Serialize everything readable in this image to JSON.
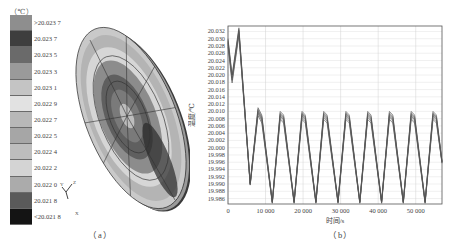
{
  "figure": {
    "panel_a": {
      "caption": "（a）",
      "unit_label": "（℃）",
      "legend": [
        {
          "label": ">20.023 7",
          "color": "#8e8e8e"
        },
        {
          "label": "20.023 7",
          "color": "#3e3e3e"
        },
        {
          "label": "20.023 5",
          "color": "#6a6a6a"
        },
        {
          "label": "20.023 3",
          "color": "#9a9a9a"
        },
        {
          "label": "20.023 1",
          "color": "#c4c4c4"
        },
        {
          "label": "20.022 9",
          "color": "#e2e2e2"
        },
        {
          "label": "20.022 7",
          "color": "#b8b8b8"
        },
        {
          "label": "20.022 5",
          "color": "#a6a6a6"
        },
        {
          "label": "20.022 4",
          "color": "#bdbdbd"
        },
        {
          "label": "20.022 2",
          "color": "#d4d4d4"
        },
        {
          "label": "20.022 0",
          "color": "#ababab"
        },
        {
          "label": "20.021 8",
          "color": "#5a5a5a"
        },
        {
          "label": "<20.021 8",
          "color": "#141414"
        }
      ],
      "axes_triad": {
        "x": "X",
        "y": "Y",
        "z": "Z"
      }
    },
    "panel_b": {
      "caption": "（b）"
    }
  },
  "chart_data": {
    "type": "line",
    "title": "",
    "xlabel": "时间/s",
    "ylabel": "温度/℃",
    "xlim": [
      0,
      57000
    ],
    "ylim": [
      19.9845,
      20.0335
    ],
    "grid": true,
    "legend": "none",
    "x_ticks": [
      0,
      10000,
      20000,
      30000,
      40000,
      50000
    ],
    "x_tick_labels": [
      "0",
      "10 000",
      "20 000",
      "30 000",
      "40 000",
      "50 000"
    ],
    "y_ticks": [
      20.032,
      20.03,
      20.028,
      20.026,
      20.024,
      20.022,
      20.02,
      20.018,
      20.016,
      20.014,
      20.012,
      20.01,
      20.008,
      20.006,
      20.004,
      20.002,
      20.0,
      19.998,
      19.996,
      19.994,
      19.992,
      19.99,
      19.988,
      19.986
    ],
    "y_tick_labels": [
      "20.032",
      "20.030",
      "20.028",
      "20.026",
      "20.024",
      "20.022",
      "20.020",
      "20.018",
      "20.016",
      "20.014",
      "20.012",
      "20.010",
      "20.008",
      "20.006",
      "20.004",
      "20.002",
      "20.000",
      "19.998",
      "19.996",
      "19.994",
      "19.992",
      "19.990",
      "19.988",
      "19.986"
    ],
    "series_description": "Bundle of many overlapping temperature curves (multiple monitoring points), drawn in gray",
    "series": [
      {
        "name": "temperature envelope (representative)",
        "x": [
          0,
          1100,
          2900,
          5900,
          8000,
          9000,
          11800,
          13900,
          14800,
          17600,
          19700,
          20600,
          23400,
          25500,
          26400,
          29300,
          31400,
          32300,
          35100,
          37200,
          38100,
          40900,
          43000,
          43900,
          46700,
          48800,
          49700,
          52500,
          54600,
          55500,
          57000
        ],
        "y": [
          20.029,
          20.019,
          20.032,
          19.99,
          20.01,
          20.008,
          19.985,
          20.009,
          20.008,
          19.985,
          20.009,
          20.008,
          19.985,
          20.009,
          20.008,
          19.985,
          20.009,
          20.008,
          19.985,
          20.009,
          20.008,
          19.985,
          20.009,
          20.008,
          19.985,
          20.009,
          20.008,
          19.985,
          20.009,
          20.008,
          19.996
        ]
      }
    ]
  }
}
